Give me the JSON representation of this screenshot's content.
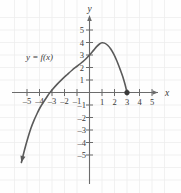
{
  "chart_data": {
    "type": "line",
    "title": "",
    "xlabel": "x",
    "ylabel": "y",
    "curve_label": "y = f(x)",
    "xlim": [
      -6,
      6
    ],
    "ylim": [
      -6,
      6
    ],
    "grid": true,
    "legend_position": "none",
    "x_ticks": [
      -5,
      -4,
      -3,
      -2,
      -1,
      1,
      2,
      3,
      4,
      5
    ],
    "y_ticks": [
      -5,
      -4,
      -3,
      -2,
      -1,
      1,
      2,
      3,
      4,
      5
    ],
    "x_tick_labels": [
      "–5",
      "–4",
      "–3",
      "–2",
      "–1",
      "1",
      "2",
      "3",
      "4",
      "5"
    ],
    "y_tick_labels": [
      "–5",
      "–4",
      "–3",
      "–2",
      "–1",
      "1",
      "2",
      "3",
      "4",
      "5"
    ],
    "series": [
      {
        "name": "f(x)",
        "points": [
          [
            -5.45,
            -5.6
          ],
          [
            -5.2,
            -4.6
          ],
          [
            -4.95,
            -3.7
          ],
          [
            -4.7,
            -2.9
          ],
          [
            -4.45,
            -2.25
          ],
          [
            -4.2,
            -1.7
          ],
          [
            -3.95,
            -1.2
          ],
          [
            -3.7,
            -0.8
          ],
          [
            -3.45,
            -0.42
          ],
          [
            -3.2,
            -0.05
          ],
          [
            -3.0,
            0.2
          ],
          [
            -2.6,
            0.65
          ],
          [
            -2.2,
            1.05
          ],
          [
            -1.8,
            1.42
          ],
          [
            -1.4,
            1.78
          ],
          [
            -1.0,
            2.1
          ],
          [
            -0.6,
            2.42
          ],
          [
            -0.3,
            2.68
          ],
          [
            0.0,
            3.0
          ],
          [
            0.3,
            3.35
          ],
          [
            0.55,
            3.65
          ],
          [
            0.8,
            3.88
          ],
          [
            1.0,
            3.98
          ],
          [
            1.2,
            3.95
          ],
          [
            1.45,
            3.78
          ],
          [
            1.7,
            3.48
          ],
          [
            1.95,
            3.05
          ],
          [
            2.2,
            2.5
          ],
          [
            2.45,
            1.85
          ],
          [
            2.65,
            1.3
          ],
          [
            2.85,
            0.62
          ],
          [
            3.0,
            0.0
          ]
        ]
      }
    ],
    "markers": [
      {
        "name": "closed-endpoint",
        "x": 3,
        "y": 0,
        "style": "filled-dot"
      }
    ],
    "arrows": [
      {
        "name": "curve-arrow-down-left",
        "x": -5.45,
        "y": -5.6
      }
    ],
    "y_intercept": 3,
    "x_intercept": -3.2,
    "maximum": {
      "x": 1,
      "y": 4
    },
    "colors": {
      "curve": "#5a5a5a",
      "axis": "#6b6b6b",
      "grid": "#eeeeee",
      "text": "#3a3a3a",
      "background": "#fefefe"
    }
  }
}
